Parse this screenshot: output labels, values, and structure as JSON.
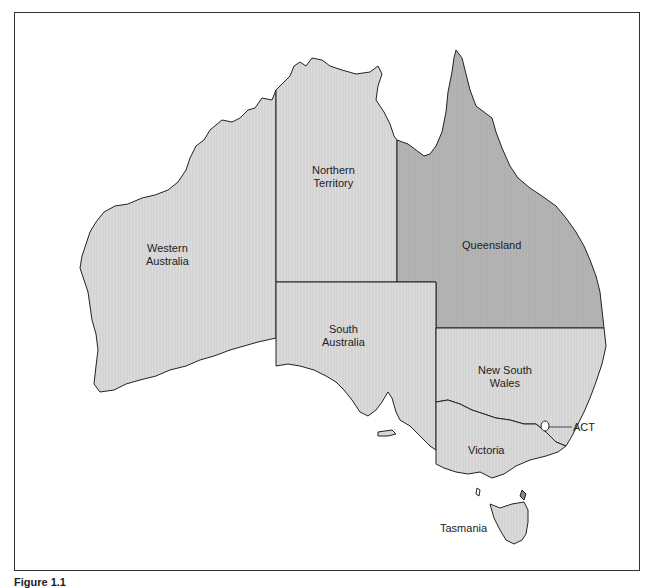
{
  "map": {
    "title": "",
    "colors": {
      "state_fill": "#d9d9d9",
      "queensland_fill": "#b3b3b3",
      "border": "#333333",
      "background": "#ffffff"
    },
    "regions": [
      {
        "id": "wa",
        "label_line1": "Western",
        "label_line2": "Australia"
      },
      {
        "id": "nt",
        "label_line1": "Northern",
        "label_line2": "Territory"
      },
      {
        "id": "qld",
        "label_line1": "Queensland",
        "label_line2": ""
      },
      {
        "id": "sa",
        "label_line1": "South",
        "label_line2": "Australia"
      },
      {
        "id": "nsw",
        "label_line1": "New South",
        "label_line2": "Wales"
      },
      {
        "id": "act",
        "label_line1": "ACT",
        "label_line2": ""
      },
      {
        "id": "vic",
        "label_line1": "Victoria",
        "label_line2": ""
      },
      {
        "id": "tas",
        "label_line1": "Tasmania",
        "label_line2": ""
      }
    ],
    "highlighted_region": "Queensland"
  },
  "caption": "Figure 1.1"
}
